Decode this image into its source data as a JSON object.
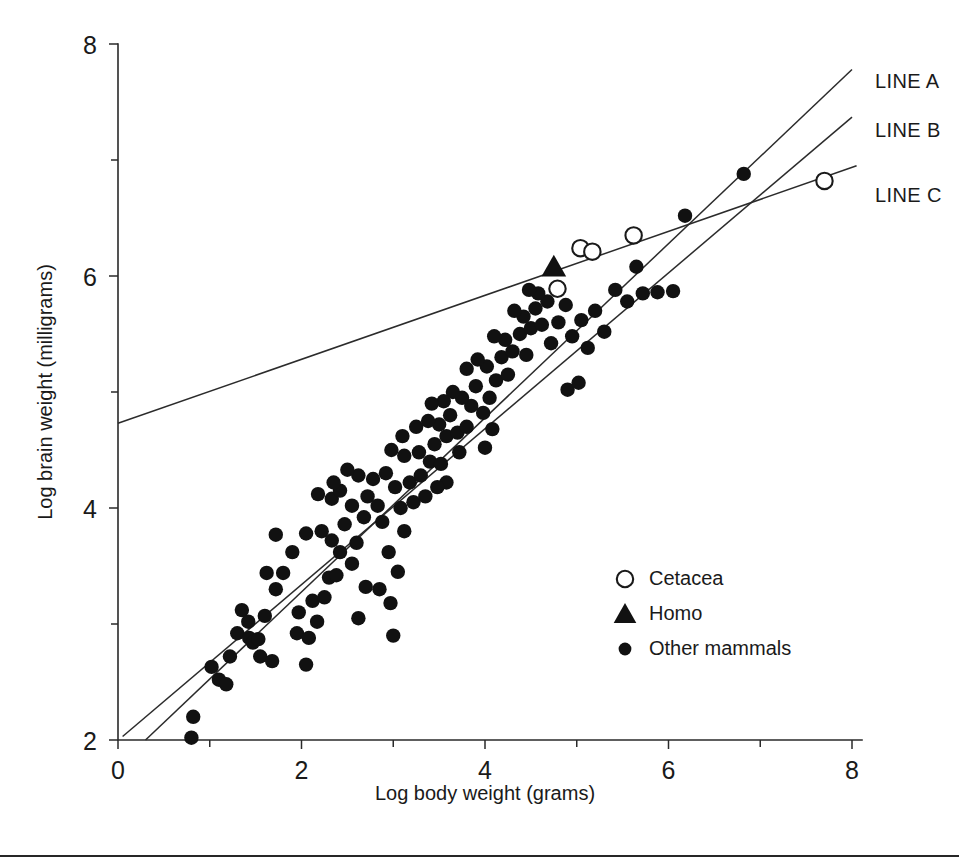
{
  "figure": {
    "background_color": "#ffffff",
    "ink_color": "#1a1a1a",
    "bottom_rule": true
  },
  "chart_data": {
    "type": "scatter",
    "title": "",
    "xlabel": "Log body weight (grams)",
    "ylabel": "Log brain weight (milligrams)",
    "xlim": [
      0,
      8
    ],
    "ylim": [
      2,
      8
    ],
    "xticks": [
      0,
      2,
      4,
      6,
      8
    ],
    "yticks": [
      2,
      4,
      6,
      8
    ],
    "xticklabels": [
      "0",
      "2",
      "4",
      "6",
      "8"
    ],
    "yticklabels": [
      "2",
      "4",
      "6",
      "8"
    ],
    "xminorticks": [
      1,
      3,
      5,
      7
    ],
    "yminorticks": [
      3,
      5,
      7
    ],
    "grid": false,
    "legend_position": "center-right",
    "legend": [
      {
        "label": "Cetacea",
        "marker": "open-circle"
      },
      {
        "label": "Homo",
        "marker": "filled-triangle"
      },
      {
        "label": "Other mammals",
        "marker": "filled-circle"
      }
    ],
    "annotations": [
      {
        "text": "LINE A",
        "x": 8.25,
        "y": 7.62
      },
      {
        "text": "LINE B",
        "x": 8.25,
        "y": 7.2
      },
      {
        "text": "LINE C",
        "x": 8.25,
        "y": 6.64
      }
    ],
    "lines": [
      {
        "name": "LINE A",
        "label": "LINE A",
        "x": [
          0.3,
          8.0
        ],
        "y": [
          2.0,
          7.78
        ],
        "slope": 0.75,
        "intercept": 1.775
      },
      {
        "name": "LINE B",
        "label": "LINE B",
        "x": [
          0.05,
          8.0
        ],
        "y": [
          2.03,
          7.37
        ],
        "slope": 0.672,
        "intercept": 1.996
      },
      {
        "name": "LINE C",
        "label": "LINE C",
        "x": [
          0.0,
          8.05
        ],
        "y": [
          4.73,
          6.95
        ],
        "slope": 0.2758,
        "intercept": 4.73
      }
    ],
    "series": [
      {
        "name": "Cetacea",
        "marker": "open-circle",
        "points": [
          [
            4.79,
            5.89
          ],
          [
            5.04,
            6.24
          ],
          [
            5.17,
            6.21
          ],
          [
            5.62,
            6.35
          ],
          [
            7.7,
            6.82
          ]
        ]
      },
      {
        "name": "Homo",
        "marker": "filled-triangle",
        "points": [
          [
            4.75,
            6.08
          ]
        ]
      },
      {
        "name": "Other mammals",
        "marker": "filled-circle",
        "points": [
          [
            0.8,
            2.02
          ],
          [
            0.82,
            2.2
          ],
          [
            1.02,
            2.63
          ],
          [
            1.22,
            2.72
          ],
          [
            1.3,
            2.92
          ],
          [
            1.43,
            2.88
          ],
          [
            1.47,
            2.84
          ],
          [
            1.53,
            2.87
          ],
          [
            1.35,
            3.12
          ],
          [
            1.6,
            3.07
          ],
          [
            1.72,
            3.3
          ],
          [
            1.62,
            3.44
          ],
          [
            1.8,
            3.44
          ],
          [
            1.9,
            3.62
          ],
          [
            1.72,
            3.77
          ],
          [
            1.97,
            3.1
          ],
          [
            2.05,
            2.65
          ],
          [
            2.17,
            3.02
          ],
          [
            2.12,
            3.2
          ],
          [
            2.25,
            3.23
          ],
          [
            2.3,
            3.4
          ],
          [
            2.38,
            3.42
          ],
          [
            2.05,
            3.78
          ],
          [
            2.22,
            3.8
          ],
          [
            2.33,
            3.72
          ],
          [
            2.42,
            3.62
          ],
          [
            2.47,
            3.86
          ],
          [
            2.55,
            3.52
          ],
          [
            2.6,
            3.7
          ],
          [
            2.68,
            3.92
          ],
          [
            2.55,
            4.02
          ],
          [
            2.33,
            4.08
          ],
          [
            2.18,
            4.12
          ],
          [
            2.72,
            4.1
          ],
          [
            2.83,
            4.02
          ],
          [
            2.88,
            3.88
          ],
          [
            2.95,
            3.62
          ],
          [
            2.97,
            3.18
          ],
          [
            3.05,
            3.45
          ],
          [
            3.12,
            3.8
          ],
          [
            3.08,
            4.0
          ],
          [
            3.02,
            4.18
          ],
          [
            2.78,
            4.25
          ],
          [
            2.62,
            4.28
          ],
          [
            2.5,
            4.33
          ],
          [
            2.92,
            4.3
          ],
          [
            3.18,
            4.22
          ],
          [
            3.22,
            4.05
          ],
          [
            3.3,
            4.28
          ],
          [
            3.35,
            4.1
          ],
          [
            3.4,
            4.4
          ],
          [
            3.28,
            4.48
          ],
          [
            3.12,
            4.45
          ],
          [
            2.98,
            4.5
          ],
          [
            3.45,
            4.55
          ],
          [
            3.52,
            4.38
          ],
          [
            3.58,
            4.62
          ],
          [
            3.5,
            4.72
          ],
          [
            3.38,
            4.75
          ],
          [
            3.25,
            4.7
          ],
          [
            3.1,
            4.62
          ],
          [
            3.62,
            4.8
          ],
          [
            3.7,
            4.65
          ],
          [
            3.72,
            4.48
          ],
          [
            3.8,
            4.7
          ],
          [
            3.85,
            4.88
          ],
          [
            3.75,
            4.95
          ],
          [
            3.65,
            5.0
          ],
          [
            3.55,
            4.92
          ],
          [
            3.42,
            4.9
          ],
          [
            3.9,
            5.05
          ],
          [
            3.98,
            4.82
          ],
          [
            4.05,
            4.95
          ],
          [
            4.12,
            5.1
          ],
          [
            4.02,
            5.22
          ],
          [
            3.92,
            5.28
          ],
          [
            3.8,
            5.2
          ],
          [
            4.18,
            5.3
          ],
          [
            4.25,
            5.15
          ],
          [
            4.3,
            5.35
          ],
          [
            4.22,
            5.45
          ],
          [
            4.1,
            5.48
          ],
          [
            4.38,
            5.5
          ],
          [
            4.45,
            5.32
          ],
          [
            4.5,
            5.55
          ],
          [
            4.42,
            5.65
          ],
          [
            4.32,
            5.7
          ],
          [
            4.55,
            5.72
          ],
          [
            4.62,
            5.58
          ],
          [
            4.68,
            5.78
          ],
          [
            4.58,
            5.85
          ],
          [
            4.48,
            5.88
          ],
          [
            4.72,
            5.42
          ],
          [
            4.8,
            5.6
          ],
          [
            4.88,
            5.75
          ],
          [
            4.95,
            5.48
          ],
          [
            5.05,
            5.62
          ],
          [
            5.12,
            5.38
          ],
          [
            5.2,
            5.7
          ],
          [
            5.3,
            5.52
          ],
          [
            5.42,
            5.88
          ],
          [
            5.55,
            5.78
          ],
          [
            5.65,
            6.08
          ],
          [
            5.72,
            5.85
          ],
          [
            5.88,
            5.86
          ],
          [
            6.05,
            5.87
          ],
          [
            6.18,
            6.52
          ],
          [
            6.82,
            6.88
          ],
          [
            1.1,
            2.52
          ],
          [
            1.18,
            2.48
          ],
          [
            1.95,
            2.92
          ],
          [
            2.08,
            2.88
          ],
          [
            2.62,
            3.05
          ],
          [
            2.7,
            3.32
          ],
          [
            2.85,
            3.3
          ],
          [
            3.0,
            2.9
          ],
          [
            1.42,
            3.02
          ],
          [
            1.55,
            2.72
          ],
          [
            1.68,
            2.68
          ],
          [
            2.42,
            4.15
          ],
          [
            2.35,
            4.22
          ],
          [
            3.58,
            4.22
          ],
          [
            3.48,
            4.18
          ],
          [
            4.0,
            4.52
          ],
          [
            4.08,
            4.68
          ],
          [
            4.9,
            5.02
          ],
          [
            5.02,
            5.08
          ]
        ]
      }
    ]
  }
}
